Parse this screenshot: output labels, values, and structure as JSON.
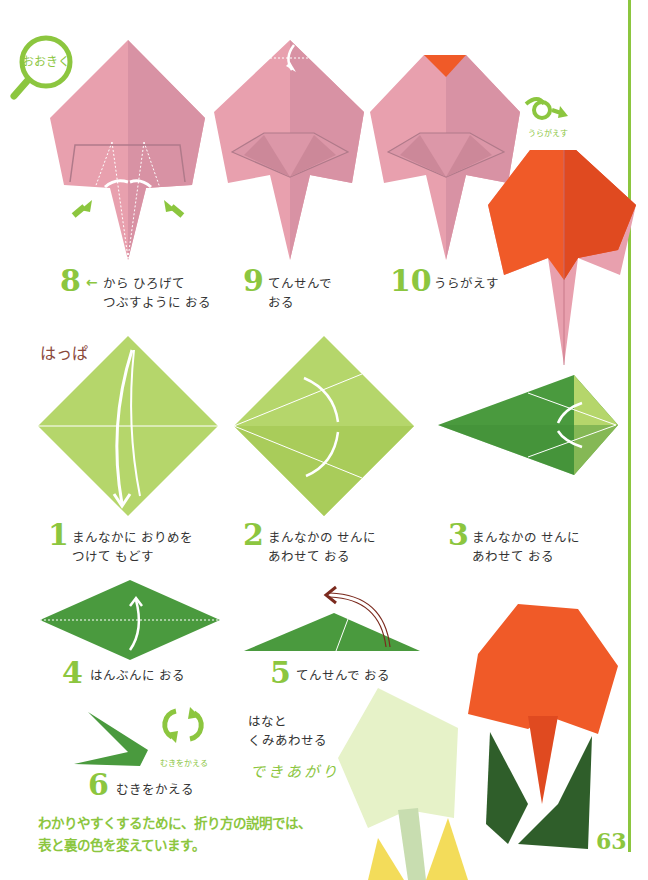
{
  "page": {
    "number": "63"
  },
  "zoom_badge": {
    "label": "おおきく"
  },
  "flip_badge": {
    "label": "うらがえす"
  },
  "rotate_badge": {
    "label": "むきをかえる"
  },
  "flower_steps": [
    {
      "num": "8",
      "text": "から ひろげて\nつぶすように おる",
      "arrow": "←"
    },
    {
      "num": "9",
      "text": "てんせんで\nおる"
    },
    {
      "num": "10",
      "text": "うらがえす"
    }
  ],
  "leaf_section": {
    "title": "はっぱ"
  },
  "leaf_steps": [
    {
      "num": "1",
      "text": "まんなかに おりめを\nつけて もどす"
    },
    {
      "num": "2",
      "text": "まんなかの せんに\nあわせて おる"
    },
    {
      "num": "3",
      "text": "まんなかの せんに\nあわせて おる"
    },
    {
      "num": "4",
      "text": "はんぶんに おる"
    },
    {
      "num": "5",
      "text": "てんせんで おる"
    },
    {
      "num": "6",
      "text": "むきをかえる"
    }
  ],
  "finish": {
    "instruction": "はなと\nくみあわせる",
    "label": "できあがり"
  },
  "note": {
    "line1": "わかりやすくするために、折り方の説明では、",
    "line2": "表と裏の色を変えています。",
    "ruby": {
      "ori": "お",
      "kata": "かた",
      "setsumei": "せつめい",
      "omote": "おもて",
      "ura": "うら",
      "iro": "いろ",
      "ka": "か"
    }
  },
  "colors": {
    "accent_green": "#8cc63f",
    "pink": "#e8a0ae",
    "pink_dark": "#c98597",
    "orange": "#f05a28",
    "leaf_light": "#b5d66b",
    "leaf_dark": "#4a9a3e",
    "leaf_deep": "#2f5e2a",
    "pale_green": "#e6f2c8",
    "yellow": "#f3dc5a",
    "brown_label": "#8b4a3c"
  }
}
